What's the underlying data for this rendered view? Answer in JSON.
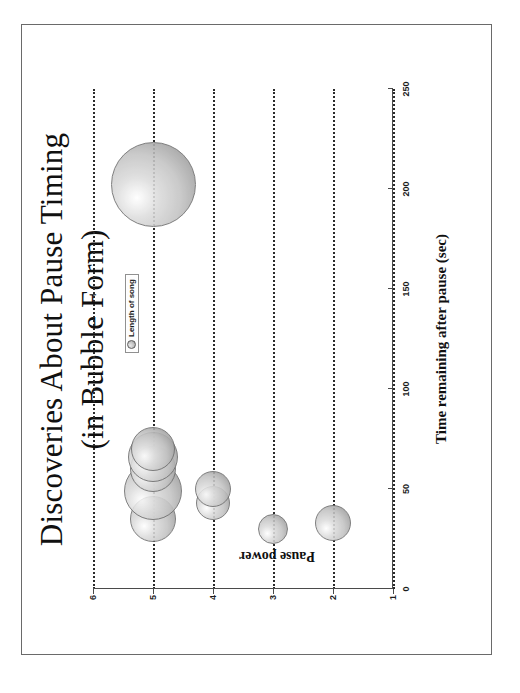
{
  "slide": {
    "title_lines": [
      "Discoveries About Pause Timing",
      "(in Bubble Form)"
    ]
  },
  "legend": {
    "entries": [
      {
        "label": "Length of song",
        "marker": "bubble-marker"
      }
    ],
    "position": "top-center-left"
  },
  "chart_data": {
    "type": "scatter",
    "title": "Discoveries About Pause Timing (in Bubble Form)",
    "subtitle": "",
    "xlabel": "Time remaining after pause (sec)",
    "ylabel": "Pause power",
    "xlim": [
      0,
      250
    ],
    "ylim": [
      1,
      6
    ],
    "xticks": [
      0,
      50,
      100,
      150,
      200,
      250
    ],
    "yticks": [
      1,
      2,
      3,
      4,
      5,
      6
    ],
    "grid": "horizontal-dotted",
    "legend_position": "top-left-of-plot",
    "bubble_size_encodes": "Length of song",
    "series": [
      {
        "name": "Length of song",
        "points": [
          {
            "x": 35,
            "y": 5,
            "size": 46
          },
          {
            "x": 49,
            "y": 5,
            "size": 58
          },
          {
            "x": 60,
            "y": 5,
            "size": 46
          },
          {
            "x": 66,
            "y": 5,
            "size": 50
          },
          {
            "x": 70,
            "y": 5,
            "size": 44
          },
          {
            "x": 202,
            "y": 5,
            "size": 85
          },
          {
            "x": 43,
            "y": 4,
            "size": 34
          },
          {
            "x": 50,
            "y": 4,
            "size": 36
          },
          {
            "x": 30,
            "y": 3,
            "size": 30
          },
          {
            "x": 33,
            "y": 2,
            "size": 36
          }
        ]
      }
    ]
  },
  "axes": {
    "x": {
      "title": "Time remaining after pause (sec)",
      "tick_labels": [
        "0",
        "50",
        "100",
        "150",
        "200",
        "250"
      ]
    },
    "y": {
      "title": "Pause power",
      "tick_labels": [
        "1",
        "2",
        "3",
        "4",
        "5",
        "6"
      ]
    }
  }
}
